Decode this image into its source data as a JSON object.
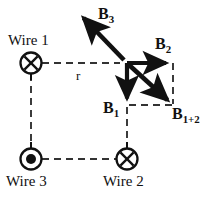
{
  "figure": {
    "type": "physics-vector-diagram",
    "background_color": "#ffffff",
    "stroke_color": "#111111"
  },
  "wires": [
    {
      "id": "wire1",
      "label": "Wire 1",
      "symbol": "x-circle",
      "current_direction": "into-page",
      "x": 31,
      "y": 63,
      "label_x": 8,
      "label_y": 33
    },
    {
      "id": "wire2",
      "label": "Wire 2",
      "symbol": "x-circle",
      "current_direction": "into-page",
      "x": 127,
      "y": 159,
      "label_x": 103,
      "label_y": 174
    },
    {
      "id": "wire3",
      "label": "Wire 3",
      "symbol": "dot-circle",
      "current_direction": "out-of-page",
      "x": 31,
      "y": 159,
      "label_x": 6,
      "label_y": 174
    }
  ],
  "field_point": {
    "x": 127,
    "y": 63
  },
  "vectors": [
    {
      "id": "B1",
      "base": "B",
      "subscript": "1",
      "direction": "down",
      "from_x": 127,
      "from_y": 63,
      "to_x": 127,
      "to_y": 105,
      "label_x": 103,
      "label_y": 100
    },
    {
      "id": "B2",
      "base": "B",
      "subscript": "2",
      "direction": "right",
      "from_x": 127,
      "from_y": 63,
      "to_x": 173,
      "to_y": 63,
      "label_x": 155,
      "label_y": 36
    },
    {
      "id": "B3",
      "base": "B",
      "subscript": "3",
      "direction": "up-left",
      "from_x": 127,
      "from_y": 63,
      "to_x": 77,
      "to_y": 11,
      "label_x": 98,
      "label_y": 6
    },
    {
      "id": "B1+2",
      "base": "B",
      "subscript": "1+2",
      "direction": "down-right",
      "from_x": 127,
      "from_y": 63,
      "to_x": 173,
      "to_y": 105,
      "label_x": 172,
      "label_y": 106
    }
  ],
  "distance_label": {
    "text": "r",
    "x": 76,
    "y": 69
  },
  "dashed_connectors": [
    {
      "id": "wire1-to-point",
      "x1": 42,
      "y1": 63,
      "x2": 120,
      "y2": 63
    },
    {
      "id": "wire1-to-wire3",
      "x1": 31,
      "y1": 74,
      "x2": 31,
      "y2": 148
    },
    {
      "id": "wire3-to-wire2",
      "x1": 42,
      "y1": 159,
      "x2": 116,
      "y2": 159
    },
    {
      "id": "point-to-wire2",
      "x1": 127,
      "y1": 105,
      "x2": 127,
      "y2": 148
    },
    {
      "id": "parallelogram-right",
      "x1": 173,
      "y1": 63,
      "x2": 173,
      "y2": 105
    },
    {
      "id": "parallelogram-bottom",
      "x1": 127,
      "y1": 105,
      "x2": 173,
      "y2": 105
    }
  ]
}
